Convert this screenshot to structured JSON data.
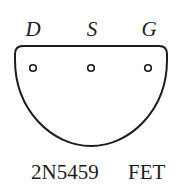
{
  "diagram": {
    "type": "transistor-pinout",
    "package_shape": "half-round (TO-92 bottom view)",
    "pins": [
      {
        "label": "D",
        "name": "drain"
      },
      {
        "label": "S",
        "name": "source"
      },
      {
        "label": "G",
        "name": "gate"
      }
    ],
    "caption": {
      "part_number": "2N5459",
      "type": "FET"
    },
    "colors": {
      "stroke": "#1c1c1c",
      "background": "#ffffff"
    }
  }
}
